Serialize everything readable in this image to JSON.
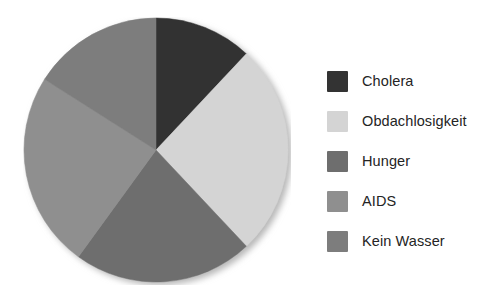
{
  "chart_data": {
    "type": "pie",
    "title": "",
    "subtitle": "",
    "xlabel": "",
    "ylabel": "",
    "grid": false,
    "legend_position": "right",
    "start_angle_deg": 0,
    "direction": "clockwise",
    "categories": [
      "Cholera",
      "Obdachlosigkeit",
      "Hunger",
      "AIDS",
      "Kein Wasser"
    ],
    "values": [
      12,
      26,
      22,
      24,
      16
    ],
    "value_unit": "percent",
    "slice_angles_deg": [
      43,
      94,
      79,
      88,
      56
    ],
    "slice_boundaries_deg": [
      0,
      43,
      137,
      216,
      304,
      360
    ],
    "colors": [
      "#333333",
      "#d4d4d4",
      "#6e6e6e",
      "#8f8f8f",
      "#7d7d7d"
    ],
    "slices": [
      {
        "label": "Cholera",
        "value": 12,
        "angle_deg": 43,
        "color": "#333333"
      },
      {
        "label": "Obdachlosigkeit",
        "value": 26,
        "angle_deg": 94,
        "color": "#d4d4d4"
      },
      {
        "label": "Hunger",
        "value": 22,
        "angle_deg": 79,
        "color": "#6e6e6e"
      },
      {
        "label": "AIDS",
        "value": 24,
        "angle_deg": 88,
        "color": "#8f8f8f"
      },
      {
        "label": "Kein Wasser",
        "value": 16,
        "angle_deg": 56,
        "color": "#7d7d7d"
      }
    ]
  },
  "legend": {
    "items": [
      {
        "label": "Cholera",
        "color": "#333333"
      },
      {
        "label": "Obdachlosigkeit",
        "color": "#d4d4d4"
      },
      {
        "label": "Hunger",
        "color": "#6e6e6e"
      },
      {
        "label": "AIDS",
        "color": "#8f8f8f"
      },
      {
        "label": "Kein Wasser",
        "color": "#7d7d7d"
      }
    ]
  },
  "theme": {
    "background": "#ffffff",
    "text_color": "#242424",
    "shadow_color": "#b9b9b9"
  }
}
